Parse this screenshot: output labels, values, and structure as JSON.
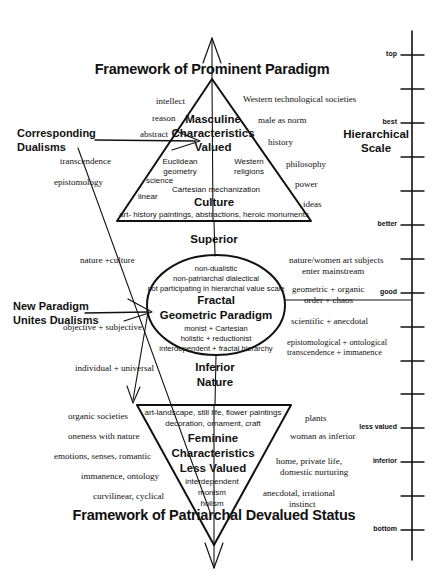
{
  "diagram": {
    "top_title": "Framework of Prominent Paradigm",
    "bottom_title": "Framework of Patriarchal Devalued Status",
    "callouts": {
      "corresponding_dualisms_l1": "Corresponding",
      "corresponding_dualisms_l2": "Dualisms",
      "new_paradigm_l1": "New Paradigm",
      "new_paradigm_l2": "Unites Dualisms"
    },
    "connectors": {
      "superior": "Superior",
      "inferior": "Inferior",
      "nature": "Nature"
    },
    "upper_triangle": {
      "heading_l1": "Masculine",
      "heading_l2": "Characteristics",
      "heading_l3": "Valued",
      "culture_label": "Culture",
      "inner_items": [
        "Euclidean",
        "geometry",
        "Western",
        "religions",
        "Cartesian mechanization"
      ],
      "base_line": "art- history paintings, abstractions, heroic monuments"
    },
    "lower_triangle": {
      "heading_l1": "Feminine",
      "heading_l2": "Characteristics",
      "heading_l3": "Less Valued",
      "top_line_1": "art-landscape, still  life, flower paintings",
      "top_line_2": "decoration, ornament, craft",
      "inner_items": [
        "interdependent",
        "monism",
        "holism"
      ]
    },
    "circle": {
      "line_1": "non-dualistic",
      "line_2": "non-patriarchal dialectical",
      "line_3": "not participating  in hierarchal value scale",
      "heading_1": "Fractal",
      "heading_2": "Geometric Paradigm",
      "line_4": "monist + Cartesian",
      "line_5": "holistic + reductionist",
      "line_6": "interdependent  + fractal hierarchy"
    },
    "upper_left_terms": [
      "intellect",
      "reason",
      "abstract",
      "transcendence",
      "epistomology",
      "science",
      "linear"
    ],
    "upper_right_terms": [
      "Western technological societies",
      "male as norm",
      "history",
      "philosophy",
      "power",
      "ideas"
    ],
    "middle_left_terms": [
      "nature +culture",
      "objective + subjective",
      "individual + universal"
    ],
    "middle_right_terms": [
      "nature/women art subjects",
      "enter mainstream",
      "geometric + organic",
      "order + chaos",
      "scientific + anecdotal",
      "epistomological + ontological",
      "transcendence + immanence"
    ],
    "lower_left_terms": [
      "organic societies",
      "oneness with nature",
      "emotions, senses, romantic",
      "immanence, ontology",
      "curvilinear, cyclical"
    ],
    "lower_right_terms": [
      "plants",
      "woman as inferior",
      "home, private life,",
      "domestic nurturing",
      "anecdotal, irrational",
      "instinct"
    ],
    "scale": {
      "title_l1": "Hierarchical",
      "title_l2": "Scale",
      "labels": [
        {
          "text": "top",
          "y": 55
        },
        {
          "text": "best",
          "y": 123
        },
        {
          "text": "better",
          "y": 225
        },
        {
          "text": "good",
          "y": 293
        },
        {
          "text": "less valued",
          "y": 428
        },
        {
          "text": "inferior",
          "y": 462
        },
        {
          "text": "bottom",
          "y": 530
        }
      ],
      "tick_ys": [
        55,
        89,
        123,
        157,
        191,
        225,
        259,
        293,
        327,
        361,
        394,
        428,
        462,
        496,
        530
      ],
      "axis_x": 412,
      "axis_top": 31,
      "axis_bottom": 560
    },
    "colors": {
      "stroke": "#111111",
      "background": "#ffffff"
    }
  }
}
